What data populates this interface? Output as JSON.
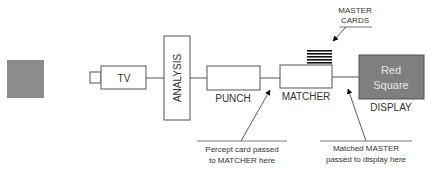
{
  "diagram": {
    "stimulus": {
      "name": "gray-square",
      "color": "#8c8c8c"
    },
    "nodes": {
      "tv": {
        "label": "TV"
      },
      "analysis": {
        "label": "ANALYSIS"
      },
      "punch": {
        "label": "PUNCH"
      },
      "matcher": {
        "label": "MATCHER"
      },
      "display": {
        "label": "DISPLAY",
        "content_line1": "Red",
        "content_line2": "Square",
        "fill": "#7f7f7f"
      }
    },
    "master_cards": {
      "line1": "MASTER",
      "line2": "CARDS",
      "card_count": 5
    },
    "callouts": {
      "percept": {
        "line1": "Percept card passed",
        "line2": "to MATCHER here"
      },
      "matched": {
        "line1": "Matched MASTER",
        "line2": "passed to display here"
      }
    },
    "colors": {
      "stroke": "#555555",
      "text": "#333333",
      "display_text": "#e8e8e8"
    }
  }
}
